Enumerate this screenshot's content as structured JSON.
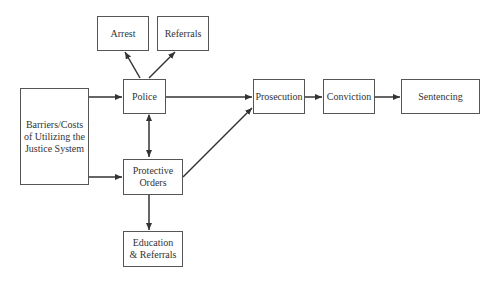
{
  "diagram": {
    "nodes": [
      {
        "id": "arrest",
        "label": "Arrest"
      },
      {
        "id": "referrals",
        "label": "Referrals"
      },
      {
        "id": "police",
        "label": "Police"
      },
      {
        "id": "barriers",
        "label": "Barriers/Costs\nof Utilizing the\nJustice System"
      },
      {
        "id": "protective_orders",
        "label": "Protective\nOrders"
      },
      {
        "id": "education",
        "label": "Education\n& Referrals"
      },
      {
        "id": "prosecution",
        "label": "Prosecution"
      },
      {
        "id": "conviction",
        "label": "Conviction"
      },
      {
        "id": "sentencing",
        "label": "Sentencing"
      }
    ],
    "edges": [
      {
        "from": "barriers",
        "to": "police"
      },
      {
        "from": "barriers",
        "to": "protective_orders"
      },
      {
        "from": "police",
        "to": "arrest"
      },
      {
        "from": "police",
        "to": "referrals"
      },
      {
        "from": "police",
        "to": "protective_orders",
        "bidirectional": true
      },
      {
        "from": "police",
        "to": "prosecution"
      },
      {
        "from": "protective_orders",
        "to": "prosecution"
      },
      {
        "from": "protective_orders",
        "to": "education"
      },
      {
        "from": "prosecution",
        "to": "conviction"
      },
      {
        "from": "conviction",
        "to": "sentencing"
      }
    ],
    "colors": {
      "stroke": "#333333",
      "box_border": "#555555",
      "text": "#333333",
      "background": "#ffffff"
    }
  }
}
